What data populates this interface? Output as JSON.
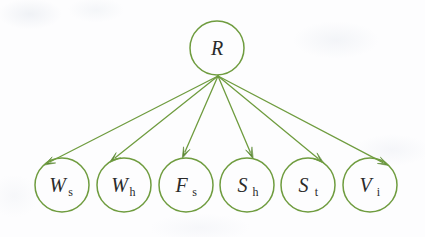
{
  "diagram": {
    "type": "bayesian-network",
    "title": "",
    "style": {
      "stroke_color": "#6f9c3f",
      "stroke_color_dark": "#5d8a34",
      "label_color": "#2a2a2a",
      "background": "#fdfdfe",
      "node_radius": 27,
      "edge_width": 1.3,
      "node_width": 1.5
    },
    "root": {
      "id": "R",
      "label_main": "R",
      "label_sub": "",
      "cx": 217,
      "cy": 48,
      "r": 27
    },
    "fan_origin": {
      "x": 218,
      "y": 76
    },
    "leaves": [
      {
        "id": "Ws",
        "label_main": "W",
        "label_sub": "s",
        "cx": 62,
        "cy": 185,
        "r": 27,
        "tip_angle_deg": 228
      },
      {
        "id": "Wh",
        "label_main": "W",
        "label_sub": "h",
        "cx": 124,
        "cy": 185,
        "r": 27,
        "tip_angle_deg": 238
      },
      {
        "id": "Fs",
        "label_main": "F",
        "label_sub": "s",
        "cx": 186,
        "cy": 185,
        "r": 27,
        "tip_angle_deg": 262
      },
      {
        "id": "Sh",
        "label_main": "S",
        "label_sub": "h",
        "cx": 247,
        "cy": 185,
        "r": 27,
        "tip_angle_deg": 283
      },
      {
        "id": "St",
        "label_main": "S",
        "label_sub": "t",
        "cx": 308,
        "cy": 185,
        "r": 27,
        "tip_angle_deg": 305
      },
      {
        "id": "Vi",
        "label_main": "V",
        "label_sub": "i",
        "cx": 370,
        "cy": 185,
        "r": 27,
        "tip_angle_deg": 314
      }
    ],
    "edges": [
      {
        "from": "R",
        "to": "Ws",
        "directed": true
      },
      {
        "from": "R",
        "to": "Wh",
        "directed": true
      },
      {
        "from": "R",
        "to": "Fs",
        "directed": true
      },
      {
        "from": "R",
        "to": "Sh",
        "directed": true
      },
      {
        "from": "R",
        "to": "St",
        "directed": true
      },
      {
        "from": "R",
        "to": "Vi",
        "directed": true
      }
    ]
  }
}
